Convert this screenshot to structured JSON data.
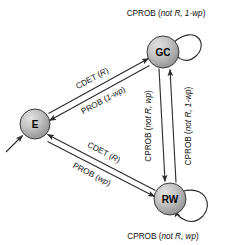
{
  "diagram": {
    "type": "state-machine",
    "background_color": "#ffffff",
    "node_fill_color": "#b6b6b6",
    "node_stroke_color": "#3a3a3a",
    "edge_color": "#2b2b2b",
    "nodes": [
      {
        "id": "E",
        "label": "E",
        "cx": 35,
        "cy": 124,
        "r": 15
      },
      {
        "id": "GC",
        "label": "GC",
        "cx": 163,
        "cy": 52,
        "r": 16
      },
      {
        "id": "RW",
        "label": "RW",
        "cx": 170,
        "cy": 199,
        "r": 16
      }
    ],
    "edges": [
      {
        "id": "e-to-gc",
        "from": "E",
        "to": "GC",
        "label_plain": "CDET (",
        "label_italic": "R",
        "label_tail": ")"
      },
      {
        "id": "gc-to-e",
        "from": "GC",
        "to": "E",
        "label_plain": "PROB (",
        "label_italic": "1-wp",
        "label_tail": ")"
      },
      {
        "id": "rw-to-e",
        "from": "RW",
        "to": "E",
        "label_plain": "CDET (",
        "label_italic": "R",
        "label_tail": ")"
      },
      {
        "id": "e-to-rw",
        "from": "E",
        "to": "RW",
        "label_plain": "PROB (",
        "label_italic": "wp",
        "label_tail": ")"
      },
      {
        "id": "gc-to-rw",
        "from": "GC",
        "to": "RW",
        "label_plain": "CPROB (",
        "label_italic": "not R, wp",
        "label_tail": ")"
      },
      {
        "id": "rw-to-gc",
        "from": "RW",
        "to": "GC",
        "label_plain": "CPROB (",
        "label_italic": "not R, 1-wp",
        "label_tail": ")"
      }
    ],
    "self_loops": [
      {
        "id": "gc-self",
        "node": "GC",
        "label_plain": "CPROB (",
        "label_italic": "not R, 1-wp",
        "label_tail": ")"
      },
      {
        "id": "rw-self",
        "node": "RW",
        "label_plain": "CPROB (",
        "label_italic": "not R, wp",
        "label_tail": ")"
      }
    ],
    "initial_arrow": {
      "id": "initial-state-arrow",
      "target": "E"
    }
  }
}
